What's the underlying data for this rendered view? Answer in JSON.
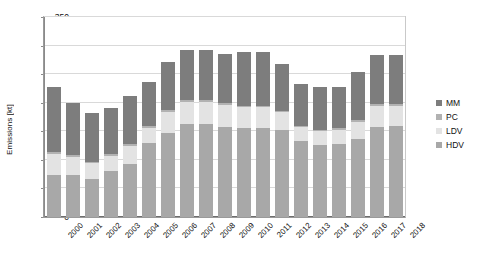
{
  "chart_data": {
    "type": "bar",
    "subtype": "stacked-vertical",
    "title": "",
    "xlabel": "",
    "ylabel": "Emissions [kt]",
    "ylim": [
      0,
      350
    ],
    "ytick_step": 50,
    "yticks": [
      "0",
      "50",
      "100",
      "150",
      "200",
      "250",
      "300",
      "350"
    ],
    "grid": true,
    "legend_position": "right",
    "categories": [
      "2000",
      "2001",
      "2002",
      "2003",
      "2004",
      "2005",
      "2006",
      "2007",
      "2008",
      "2009",
      "2010",
      "2011",
      "2012",
      "2013",
      "2014",
      "2015",
      "2016",
      "2017",
      "2018"
    ],
    "series": [
      {
        "name": "HDV",
        "color": "#a8a8a8",
        "values": [
          73,
          73,
          67,
          80,
          93,
          129,
          147,
          163,
          162,
          158,
          155,
          155,
          152,
          133,
          126,
          128,
          137,
          158,
          159
        ]
      },
      {
        "name": "LDV",
        "color": "#e3e3e3",
        "values": [
          37,
          32,
          27,
          27,
          32,
          27,
          37,
          38,
          39,
          38,
          37,
          37,
          31,
          24,
          24,
          24,
          29,
          36,
          35
        ]
      },
      {
        "name": "PC",
        "color": "#b2b2b2",
        "values": [
          3,
          3,
          3,
          3,
          3,
          3,
          3,
          3,
          3,
          3,
          3,
          3,
          3,
          3,
          3,
          3,
          3,
          3,
          3
        ]
      },
      {
        "name": "MM",
        "color": "#7d7d7d",
        "values": [
          114,
          92,
          85,
          80,
          84,
          77,
          85,
          88,
          88,
          86,
          94,
          94,
          82,
          72,
          75,
          73,
          84,
          87,
          87
        ]
      }
    ],
    "totals": [
      227,
      200,
      182,
      190,
      212,
      236,
      272,
      292,
      292,
      285,
      289,
      289,
      268,
      232,
      228,
      228,
      253,
      284,
      284
    ]
  },
  "legend": {
    "items": [
      {
        "label": "MM",
        "color": "#7d7d7d"
      },
      {
        "label": "PC",
        "color": "#b2b2b2"
      },
      {
        "label": "LDV",
        "color": "#e3e3e3"
      },
      {
        "label": "HDV",
        "color": "#a8a8a8"
      }
    ]
  }
}
